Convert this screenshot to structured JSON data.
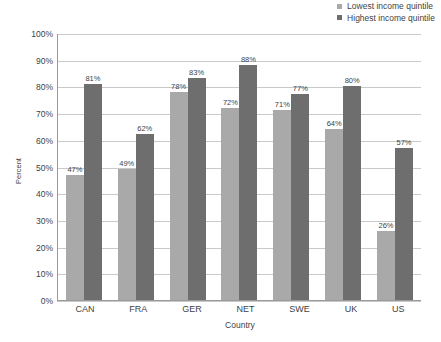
{
  "chart_data": {
    "type": "bar",
    "title": "",
    "subtitle": "",
    "xlabel": "Country",
    "ylabel": "Percent",
    "categories": [
      "CAN",
      "FRA",
      "GER",
      "NET",
      "SWE",
      "UK",
      "US"
    ],
    "series": [
      {
        "name": "Lowest income quintile",
        "color": "#a9a9a9",
        "values": [
          47,
          49,
          78,
          72,
          71,
          64,
          26
        ],
        "labels": [
          "47%",
          "49%",
          "78%",
          "72%",
          "71%",
          "64%",
          "26%"
        ]
      },
      {
        "name": "Highest income quintile",
        "color": "#6e6e6e",
        "values": [
          81,
          62,
          83,
          88,
          77,
          80,
          57
        ],
        "labels": [
          "81%",
          "62%",
          "83%",
          "88%",
          "77%",
          "80%",
          "57%"
        ]
      }
    ],
    "ylim": [
      0,
      100
    ],
    "ytick_values": [
      100,
      90,
      80,
      70,
      60,
      50,
      40,
      30,
      20,
      10,
      0
    ],
    "ytick_labels": [
      "100%",
      "90%",
      "80%",
      "70%",
      "60%",
      "50%",
      "40%",
      "30%",
      "20%",
      "10%",
      "0%"
    ],
    "grid": "horizontal",
    "legend_position": "top-right",
    "legend": [
      {
        "label": "Lowest income quintile",
        "color": "#a9a9a9"
      },
      {
        "label": "Highest income quintile",
        "color": "#6e6e6e"
      }
    ]
  }
}
